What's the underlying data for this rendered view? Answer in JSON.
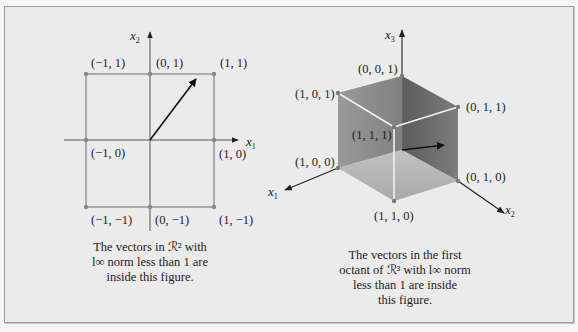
{
  "left_figure": {
    "axes": {
      "x": "x",
      "x_sub": "1",
      "y": "x",
      "y_sub": "2"
    },
    "points": [
      {
        "label": "(−1, 1)"
      },
      {
        "label": "(0, 1)"
      },
      {
        "label": "(1, 1)"
      },
      {
        "label": "(−1, 0)"
      },
      {
        "label": "(1, 0)"
      },
      {
        "label": "(−1, −1)"
      },
      {
        "label": "(0, −1)"
      },
      {
        "label": "(1, −1)"
      }
    ],
    "caption": [
      "The vectors in ℛ² with",
      "l∞ norm less than 1 are",
      "inside this figure."
    ]
  },
  "right_figure": {
    "axes": {
      "x1": "x",
      "x1_sub": "1",
      "x2": "x",
      "x2_sub": "2",
      "x3": "x",
      "x3_sub": "3"
    },
    "points": [
      {
        "label": "(0, 0, 1)"
      },
      {
        "label": "(1, 0, 1)"
      },
      {
        "label": "(0, 1, 1)"
      },
      {
        "label": "(1, 1, 1)"
      },
      {
        "label": "(1, 0, 0)"
      },
      {
        "label": "(0, 1, 0)"
      },
      {
        "label": "(1, 1, 0)"
      }
    ],
    "caption": [
      "The vectors in the first",
      "octant of ℛ³ with l∞ norm",
      "less than 1 are inside",
      "this figure."
    ]
  },
  "colors": {
    "frame_bg": "#ebebeb",
    "line": "#8a8a8a",
    "axis": "#333333",
    "cube_top": "#9e9e9e",
    "cube_left": "#8c8c8c",
    "cube_right": "#6f6f6f",
    "cube_bottom": "#b4b4b4",
    "edge_highlight": "#f2f2f2"
  }
}
